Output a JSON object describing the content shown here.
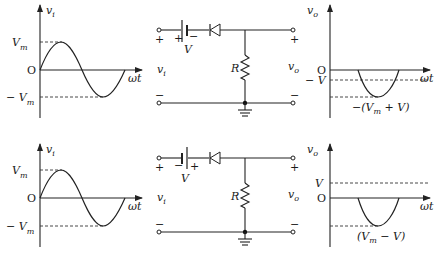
{
  "rows": [
    {
      "input_graph": {
        "y_label": "v",
        "y_label_sub": "i",
        "x_label": "ωt",
        "origin_label": "O",
        "peak_label": "V",
        "peak_sub": "m",
        "trough_prefix": "− V",
        "trough_sub": "m"
      },
      "circuit": {
        "battery_label": "V",
        "battery_left_sign": "+",
        "battery_right_sign": "−",
        "input_plus": "+",
        "input_minus": "−",
        "output_plus": "+",
        "output_minus": "−",
        "input_label": "v",
        "input_sub": "i",
        "output_label": "v",
        "output_sub": "o",
        "resistor_label": "R"
      },
      "output_graph": {
        "y_label": "v",
        "y_label_sub": "o",
        "x_label": "ωt",
        "origin_label": "O",
        "level_label": "− V",
        "min_label_pre": "−(V",
        "min_label_sub": "m",
        "min_label_post": " + V)"
      }
    },
    {
      "input_graph": {
        "y_label": "v",
        "y_label_sub": "i",
        "x_label": "ωt",
        "origin_label": "O",
        "peak_label": "V",
        "peak_sub": "m",
        "trough_prefix": "− V",
        "trough_sub": "m"
      },
      "circuit": {
        "battery_label": "V",
        "battery_left_sign": "−",
        "battery_right_sign": "+",
        "input_plus": "+",
        "input_minus": "−",
        "output_plus": "+",
        "output_minus": "−",
        "input_label": "v",
        "input_sub": "i",
        "output_label": "v",
        "output_sub": "o",
        "resistor_label": "R"
      },
      "output_graph": {
        "y_label": "v",
        "y_label_sub": "o",
        "x_label": "ωt",
        "origin_label": "O",
        "level_label": "V",
        "min_label_pre": "(V",
        "min_label_sub": "m",
        "min_label_post": " − V)"
      }
    }
  ]
}
